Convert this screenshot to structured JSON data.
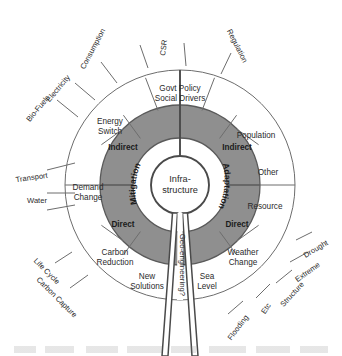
{
  "diagram": {
    "type": "radial-sunburst",
    "center": {
      "line1": "Infra-",
      "line2": "structure"
    },
    "hemispheres": [
      {
        "name": "mitigation",
        "label": "Mitigation",
        "side": "left"
      },
      {
        "name": "adaptation",
        "label": "Adaptation",
        "side": "right"
      }
    ],
    "bands": [
      {
        "name": "mitigation-indirect",
        "label": "Indirect",
        "hemisphere": "mitigation"
      },
      {
        "name": "mitigation-direct",
        "label": "Direct",
        "hemisphere": "mitigation"
      },
      {
        "name": "adaptation-indirect",
        "label": "Indirect",
        "hemisphere": "adaptation"
      },
      {
        "name": "adaptation-direct",
        "label": "Direct",
        "hemisphere": "adaptation"
      }
    ],
    "spoke": {
      "label": "Geo-engineering?"
    },
    "outer_segments": [
      {
        "name": "govt-policy",
        "line1": "Govt Policy",
        "line2": "Social Drivers"
      },
      {
        "name": "population",
        "line1": "Population",
        "line2": ""
      },
      {
        "name": "other",
        "line1": "Other",
        "line2": ""
      },
      {
        "name": "resource",
        "line1": "Resource",
        "line2": ""
      },
      {
        "name": "weather-change",
        "line1": "Weather",
        "line2": "Change"
      },
      {
        "name": "sea-level",
        "line1": "Sea",
        "line2": "Level"
      },
      {
        "name": "new-solutions",
        "line1": "New",
        "line2": "Solutions"
      },
      {
        "name": "carbon-reduction",
        "line1": "Carbon",
        "line2": "Reduction"
      },
      {
        "name": "demand-change",
        "line1": "Demand",
        "line2": "Change"
      },
      {
        "name": "energy-switch",
        "line1": "Energy",
        "line2": "Switch"
      }
    ],
    "external_labels": [
      {
        "name": "bio-fuels",
        "label": "Bio-Fuels"
      },
      {
        "name": "electricity",
        "label": "Electricity"
      },
      {
        "name": "consumption",
        "label": "Consumption"
      },
      {
        "name": "csr",
        "label": "CSR"
      },
      {
        "name": "regulation",
        "label": "Regulation"
      },
      {
        "name": "drought",
        "label": "Drought"
      },
      {
        "name": "extreme",
        "label": "Extreme"
      },
      {
        "name": "structure",
        "label": "Structure"
      },
      {
        "name": "etc",
        "label": "Etc"
      },
      {
        "name": "flooding",
        "label": "Flooding"
      },
      {
        "name": "carbon-capture",
        "label": "Carbon Capture"
      },
      {
        "name": "life-cycle",
        "label": "Life Cycle"
      },
      {
        "name": "water",
        "label": "Water"
      },
      {
        "name": "transport",
        "label": "Transport"
      }
    ],
    "colors": {
      "band_fill": "#8f8f8f",
      "ring_fill": "#ffffff",
      "stroke": "#6d6d6d",
      "text": "#2b2b2b"
    }
  }
}
